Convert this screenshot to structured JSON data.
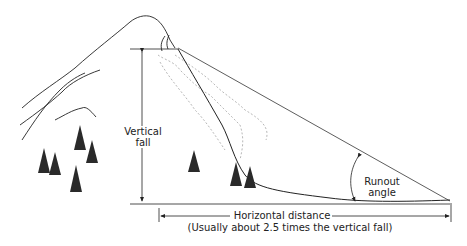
{
  "diagram": {
    "type": "avalanche runout angle illustration",
    "labels": {
      "vertical_fall_line1": "Vertical",
      "vertical_fall_line2": "fall",
      "runout_angle_line1": "Runout",
      "runout_angle_line2": "angle",
      "horizontal_distance": "Horizontal distance",
      "horizontal_note": "(Usually about 2.5 times the vertical fall)"
    },
    "colors": {
      "line": "#222222",
      "debris": "#b8b8b8",
      "tree": "#2a2a2a"
    }
  }
}
